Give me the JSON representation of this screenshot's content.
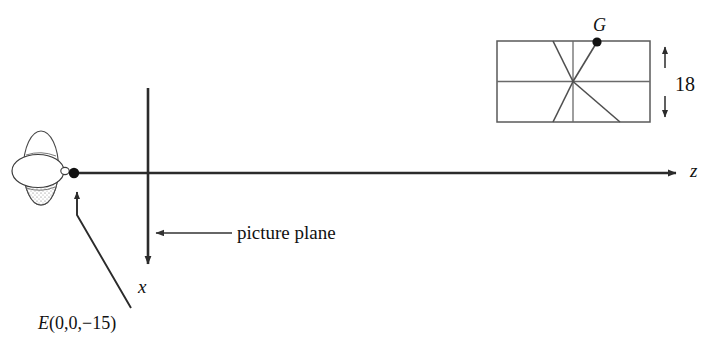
{
  "diagram": {
    "background_color": "#ffffff",
    "line_color": "#2b2b2b",
    "box_line_color": "#5a5a5a"
  },
  "axes": {
    "z_axis": {
      "label": "z",
      "icon": "arrow-right-icon",
      "start_x": 74,
      "end_x": 683,
      "y": 173
    },
    "x_axis": {
      "label": "x",
      "icon": "arrow-down-icon",
      "x": 148,
      "start_y": 88,
      "end_y": 270
    }
  },
  "eye": {
    "name": "eye-icon",
    "point_label": "E(0,0,−15)",
    "point_label_letter": "E",
    "point_label_coords": "(0,0,−15)",
    "point_x": 74,
    "point_y": 173
  },
  "picture_plane": {
    "label": "picture plane",
    "arrow_icon": "arrow-left-icon",
    "arrow_from_x": 232,
    "arrow_to_x": 152,
    "arrow_y": 233
  },
  "object_box": {
    "name": "object-box",
    "left": 497,
    "top": 41,
    "right": 650,
    "bottom": 122,
    "mid_y": 81,
    "center_x": 573,
    "vertex_label": "G",
    "vertex_x": 597,
    "vertex_y": 42,
    "diagonal_left_top_x": 553,
    "diagonal_left_bottom_x": 553,
    "diagonal_right_bottom_x": 620
  },
  "dimension": {
    "label": "18",
    "icon": "double-arrow-vertical-icon",
    "x": 665,
    "top_y": 41,
    "bottom_y": 122
  }
}
